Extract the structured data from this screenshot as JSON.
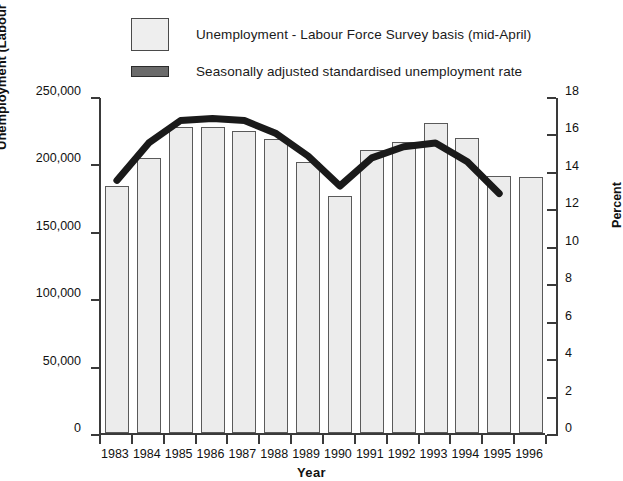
{
  "legend": {
    "items": [
      {
        "label": "Unemployment - Labour Force Survey basis (mid-April)",
        "marker": "bar-swatch",
        "color": "#ececec"
      },
      {
        "label": "Seasonally adjusted standardised unemployment rate",
        "marker": "line-swatch",
        "color": "#2b2b2b"
      }
    ]
  },
  "axes": {
    "left_title": "Unemployment (Labour Force Survey Basis)",
    "right_title": "Percent",
    "x_title": "Year",
    "left_ticks": [
      "0",
      "50,000",
      "100,000",
      "150,000",
      "200,000",
      "250,000"
    ],
    "right_ticks": [
      "0",
      "2",
      "4",
      "6",
      "8",
      "10",
      "12",
      "14",
      "16",
      "18"
    ]
  },
  "chart_data": {
    "type": "bar",
    "title": "",
    "xlabel": "Year",
    "ylabel": "Unemployment (Labour Force Survey Basis)",
    "y2label": "Percent",
    "ylim": [
      0,
      250000
    ],
    "y2lim": [
      0,
      18
    ],
    "ytick_values": [
      0,
      50000,
      100000,
      150000,
      200000,
      250000
    ],
    "y2tick_values": [
      0,
      2,
      4,
      6,
      8,
      10,
      12,
      14,
      16,
      18
    ],
    "grid": false,
    "legend_position": "top",
    "categories": [
      "1983",
      "1984",
      "1985",
      "1986",
      "1987",
      "1988",
      "1989",
      "1990",
      "1991",
      "1992",
      "1993",
      "1994",
      "1995",
      "1996"
    ],
    "series": [
      {
        "name": "Unemployment - Labour Force Survey basis (mid-April)",
        "type": "bar",
        "axis": "left",
        "color": "#ececec",
        "edge_color": "#5a5a5a",
        "values": [
          183000,
          204000,
          227000,
          227000,
          224000,
          218000,
          201000,
          176000,
          210000,
          216000,
          230000,
          219000,
          191000,
          190000
        ]
      },
      {
        "name": "Seasonally adjusted standardised unemployment rate",
        "type": "line",
        "axis": "right",
        "color": "#1a1a1a",
        "line_width": 7,
        "x": [
          "1983",
          "1984",
          "1985",
          "1986",
          "1987",
          "1988",
          "1989",
          "1990",
          "1991",
          "1992",
          "1993",
          "1994",
          "1995"
        ],
        "values": [
          13.6,
          15.6,
          16.8,
          16.9,
          16.8,
          16.1,
          14.9,
          13.3,
          14.8,
          15.4,
          15.6,
          14.6,
          12.9
        ]
      }
    ]
  }
}
